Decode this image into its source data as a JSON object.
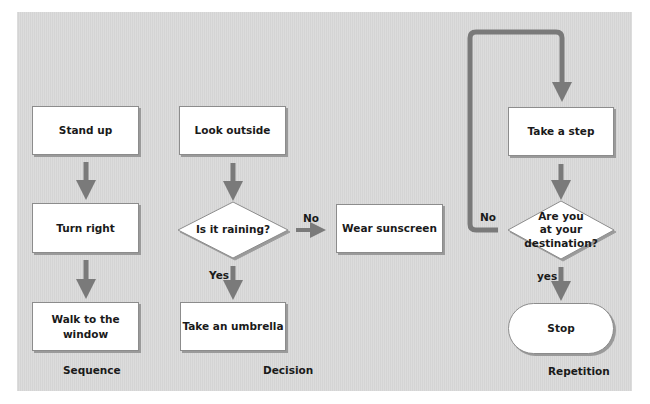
{
  "colors": {
    "panel": "#d8d8d8",
    "box_fill": "#ffffff",
    "box_border": "#8c8c8c",
    "arrow": "#7a7a7a",
    "text": "#1a1a1a"
  },
  "sequence": {
    "caption": "Sequence",
    "steps": [
      "Stand up",
      "Turn right",
      "Walk to the window"
    ],
    "steps_display": {
      "walk_line1": "Walk to the",
      "walk_line2": "window"
    }
  },
  "decision": {
    "caption": "Decision",
    "start": "Look outside",
    "question": "Is it raining?",
    "yes_label": "Yes",
    "no_label": "No",
    "yes_action": "Take an umbrella",
    "no_action": "Wear sunscreen"
  },
  "repetition": {
    "caption": "Repetition",
    "step": "Take a step",
    "question_lines": [
      "Are you",
      "at your",
      "destination?"
    ],
    "no_label": "No",
    "yes_label": "yes",
    "end": "Stop"
  }
}
